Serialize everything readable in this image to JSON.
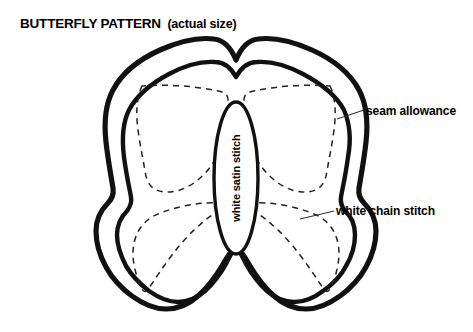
{
  "page": {
    "background_color": "#ffffff",
    "ink_color": "#000000",
    "width": 473,
    "height": 332
  },
  "title": {
    "main": "BUTTERFLY PATTERN",
    "parenthetical": "(actual size)"
  },
  "diagram": {
    "body_label": "white satin stitch",
    "layers": [
      {
        "name": "seam-allowance-outline",
        "style": "solid-thick",
        "color": "#000000"
      },
      {
        "name": "chain-stitch-outline",
        "style": "solid-thick",
        "color": "#000000"
      },
      {
        "name": "stitch-guide-line",
        "style": "dashed-thin",
        "color": "#000000"
      },
      {
        "name": "body-oval",
        "style": "solid-medium",
        "color": "#000000"
      }
    ]
  },
  "callouts": [
    {
      "id": "seam-allowance",
      "label": "seam allowance",
      "target": "outer-contour",
      "leader": {
        "x1": 337,
        "y1": 119,
        "x2": 364,
        "y2": 110
      }
    },
    {
      "id": "white-chain-stitch",
      "label": "white chain stitch",
      "target": "inner-contour",
      "leader": {
        "x1": 300,
        "y1": 219,
        "x2": 334,
        "y2": 211
      }
    }
  ]
}
